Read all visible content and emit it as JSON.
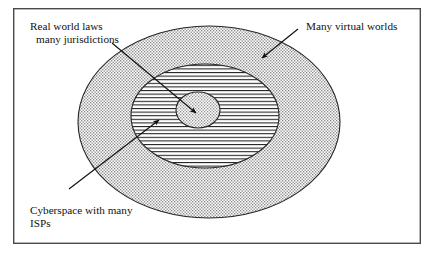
{
  "figure": {
    "kind": "nested-ellipse-venn-diagram",
    "background_color": "#ffffff",
    "frame": {
      "name": "figure-border",
      "x": 13,
      "y": 8,
      "width": 408,
      "height": 236,
      "stroke_color": "#4a4a4a"
    },
    "labels": {
      "outer": {
        "text": "Many virtual worlds",
        "x": 306,
        "y": 30
      },
      "inner_line1": {
        "text": "Real world laws",
        "x": 30,
        "y": 30
      },
      "inner_line2": {
        "text": "many jurisdictions",
        "x": 36,
        "y": 43
      },
      "middle_line1": {
        "text": "Cyberspace with many",
        "x": 30,
        "y": 214
      },
      "middle_line2": {
        "text": "ISPs",
        "x": 30,
        "y": 227
      }
    },
    "regions": [
      {
        "name": "outer-ellipse-many-virtual-worlds",
        "label_ref": "Many virtual worlds",
        "cx": 209,
        "cy": 122,
        "rx": 131,
        "ry": 96,
        "fill_pattern": "fine-dot-stipple",
        "fill_color": "#8a8a8a",
        "stroke_color": "#262626"
      },
      {
        "name": "middle-ellipse-cyberspace-with-many-isps",
        "label_ref": "Cyberspace with many ISPs",
        "cx": 205,
        "cy": 116,
        "rx": 74,
        "ry": 52,
        "fill_pattern": "horizontal-lines",
        "fill_color": "#1f1f1f",
        "stroke_color": "#262626"
      },
      {
        "name": "inner-ellipse-real-world-laws-many-jurisdictions",
        "label_ref": "Real world laws many jurisdictions",
        "cx": 198,
        "cy": 110,
        "rx": 22,
        "ry": 18,
        "fill_pattern": "fine-dot-stipple",
        "fill_color": "#8a8a8a",
        "stroke_color": "#1a1a1a"
      }
    ],
    "arrows": [
      {
        "name": "arrow-real-world-laws-to-inner-ellipse",
        "from_label": "many jurisdictions",
        "to_region": "inner-ellipse-real-world-laws-many-jurisdictions",
        "x1": 112,
        "y1": 43,
        "x2": 196,
        "y2": 113
      },
      {
        "name": "arrow-cyberspace-to-middle-ellipse",
        "from_label": "Cyberspace with many ISPs",
        "to_region": "middle-ellipse-cyberspace-with-many-isps",
        "x1": 69,
        "y1": 189,
        "x2": 159,
        "y2": 120
      },
      {
        "name": "arrow-many-virtual-worlds-to-outer-ellipse",
        "from_label": "Many virtual worlds",
        "to_region": "outer-ellipse-many-virtual-worlds",
        "x1": 298,
        "y1": 29,
        "x2": 262,
        "y2": 58
      }
    ]
  }
}
